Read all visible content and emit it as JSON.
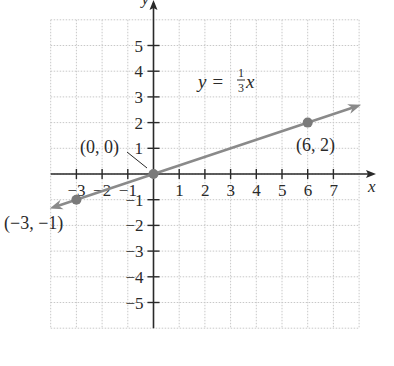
{
  "chart_data": {
    "type": "line",
    "title": "",
    "xlabel": "x",
    "ylabel": "y",
    "xlim": [
      -4,
      8
    ],
    "ylim": [
      -6,
      6
    ],
    "grid": true,
    "x_ticks": [
      -3,
      -2,
      -1,
      1,
      2,
      3,
      4,
      5,
      6,
      7
    ],
    "y_ticks": [
      5,
      4,
      3,
      2,
      1,
      -1,
      -2,
      -3,
      -4,
      -5
    ],
    "x_tick_labels": [
      "−3",
      "−2",
      "−1",
      "1",
      "2",
      "3",
      "4",
      "5",
      "6",
      "7"
    ],
    "y_tick_labels": [
      "5",
      "4",
      "3",
      "2",
      "1",
      "−1",
      "−2",
      "−3",
      "−4",
      "−5"
    ],
    "series": [
      {
        "name": "y = 1/3 x",
        "slope": 0.3333,
        "intercept": 0,
        "x": [
          -4,
          8
        ],
        "y": [
          -1.33,
          2.67
        ],
        "color": "#8a8a8a",
        "arrows": "both"
      }
    ],
    "points": [
      {
        "x": -3,
        "y": -1,
        "label": "(−3, −1)"
      },
      {
        "x": 0,
        "y": 0,
        "label": "(0, 0)"
      },
      {
        "x": 6,
        "y": 2,
        "label": "(6, 2)"
      }
    ],
    "annotations": [
      {
        "text": "y = 1/3 x",
        "x": 2,
        "y": 3.3
      }
    ]
  },
  "equation": {
    "lhs": "y",
    "equals": "=",
    "numerator": "1",
    "denominator": "3",
    "var": "x"
  },
  "axes": {
    "x_name": "x",
    "y_name": "y"
  },
  "colors": {
    "axis": "#2a2a2a",
    "grid": "#c8c8c8",
    "line": "#8a8a8a",
    "point": "#7a7a7a"
  }
}
